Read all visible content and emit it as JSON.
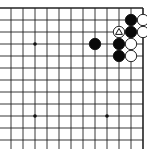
{
  "board": {
    "title": "Go board diagram (upper-right corner)",
    "origin_x": 11,
    "origin_y": 8,
    "spacing": 12,
    "cols": 12,
    "rows": 12,
    "edges": {
      "top": true,
      "right": true,
      "left": false,
      "bottom": false
    },
    "line_color": "#222222",
    "star_points": [
      [
        2,
        3
      ],
      [
        2,
        9
      ],
      [
        8,
        9
      ]
    ],
    "stones": [
      {
        "color": "black",
        "col": 10,
        "row": 1
      },
      {
        "color": "white",
        "col": 11,
        "row": 1
      },
      {
        "color": "white",
        "col": 9,
        "row": 2,
        "marker": "triangle"
      },
      {
        "color": "black",
        "col": 10,
        "row": 2
      },
      {
        "color": "white",
        "col": 11,
        "row": 2
      },
      {
        "color": "black",
        "col": 7,
        "row": 3
      },
      {
        "color": "black",
        "col": 9,
        "row": 3
      },
      {
        "color": "white",
        "col": 10,
        "row": 3
      },
      {
        "color": "black",
        "col": 9,
        "row": 4
      },
      {
        "color": "white",
        "col": 10,
        "row": 4
      }
    ]
  }
}
